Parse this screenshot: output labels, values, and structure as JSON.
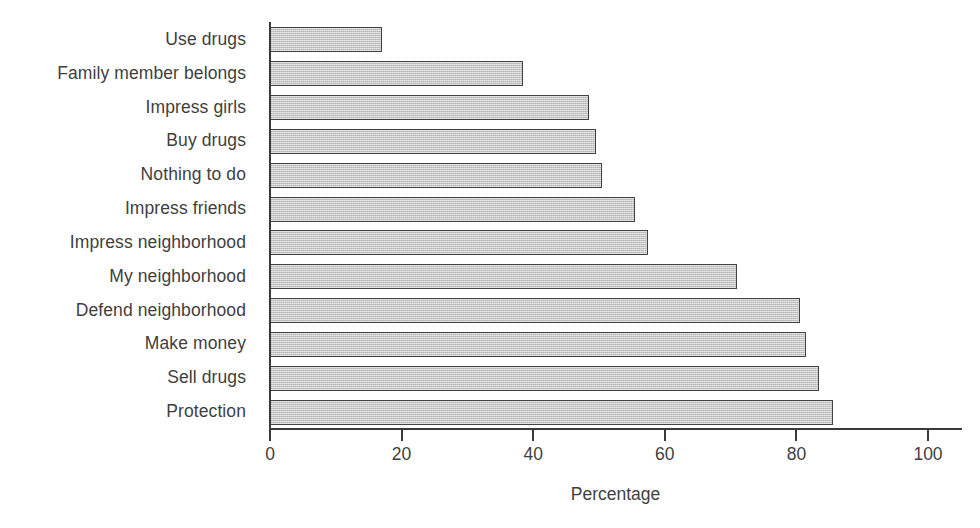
{
  "chart_data": {
    "type": "bar",
    "orientation": "horizontal",
    "title": "",
    "xlabel": "Percentage",
    "ylabel": "",
    "xlim": [
      0,
      100
    ],
    "xticks": [
      0,
      20,
      40,
      60,
      80,
      100
    ],
    "grid": false,
    "legend": null,
    "bar_color": "#c6c6c6",
    "bar_edge_color": "#434343",
    "text_color": "#3f3f3f",
    "categories": [
      "Use drugs",
      "Family member belongs",
      "Impress girls",
      "Buy drugs",
      "Nothing to do",
      "Impress friends",
      "Impress neighborhood",
      "My neighborhood",
      "Defend neighborhood",
      "Make money",
      "Sell drugs",
      "Protection"
    ],
    "values": [
      17,
      38.5,
      48.5,
      49.5,
      50.5,
      55.5,
      57.5,
      71,
      80.5,
      81.5,
      83.5,
      85.5
    ]
  },
  "axis": {
    "x_title": "Percentage",
    "tick_labels": [
      "0",
      "20",
      "40",
      "60",
      "80",
      "100"
    ]
  }
}
